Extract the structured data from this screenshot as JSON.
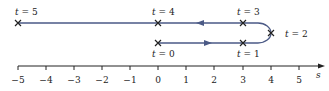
{
  "diagram": {
    "type": "position-time path on number line",
    "axis": {
      "label": "s",
      "ticks": [
        {
          "value": -5,
          "label": "−5"
        },
        {
          "value": -4,
          "label": "−4"
        },
        {
          "value": -3,
          "label": "−3"
        },
        {
          "value": -2,
          "label": "−2"
        },
        {
          "value": -1,
          "label": "−1"
        },
        {
          "value": 0,
          "label": "0"
        },
        {
          "value": 1,
          "label": "1"
        },
        {
          "value": 2,
          "label": "2"
        },
        {
          "value": 3,
          "label": "3"
        },
        {
          "value": 4,
          "label": "4"
        },
        {
          "value": 5,
          "label": "5"
        }
      ]
    },
    "points": [
      {
        "t": 0,
        "s": 0,
        "label": "t = 0"
      },
      {
        "t": 1,
        "s": 3,
        "label": "t = 1"
      },
      {
        "t": 2,
        "s": 4,
        "label": "t = 2"
      },
      {
        "t": 3,
        "s": 3,
        "label": "t = 3"
      },
      {
        "t": 4,
        "s": 0,
        "label": "t = 4"
      },
      {
        "t": 5,
        "s": -5,
        "label": "t = 5"
      }
    ],
    "colors": {
      "path": "#4b5a86",
      "axis": "#222222",
      "text": "#222222"
    }
  }
}
